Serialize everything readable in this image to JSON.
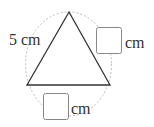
{
  "diagram": {
    "type": "triangle-inscribed-in-circle",
    "colors": {
      "stroke": "#333333",
      "circle": "#b8b8b8",
      "box": "#888888"
    },
    "shapes": {
      "triangle": {
        "vertices": [
          [
            69,
            12
          ],
          [
            27,
            85
          ],
          [
            110,
            85
          ]
        ]
      },
      "circle": {
        "cx": 68.5,
        "cy": 64,
        "rx": 43,
        "ry": 52,
        "style": "dashed"
      }
    },
    "labels": {
      "left_side": "5 cm",
      "right_side_unit": "cm",
      "bottom_side_unit": "cm"
    },
    "answer_boxes": {
      "right_side": "",
      "bottom_side": ""
    }
  }
}
